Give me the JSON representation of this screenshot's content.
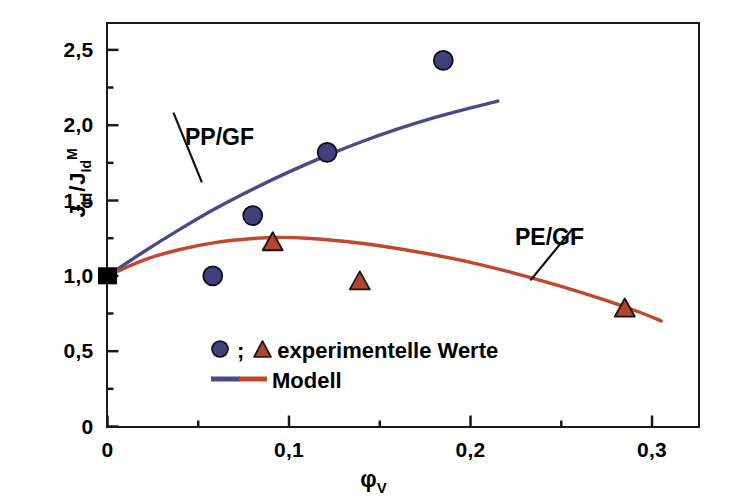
{
  "chart_data": {
    "type": "scatter",
    "title": "",
    "xlabel": "φ_V",
    "xlabel_base": "φ",
    "xlabel_sub": "V",
    "ylabel": "J_Id / J_Id^M",
    "ylabel_parts": {
      "j1": "J",
      "j1_sub": "Id",
      "slash": "/",
      "j2": "J",
      "j2_sub": "Id",
      "j2_sup": "M"
    },
    "xlim": [
      0,
      0.3256
    ],
    "ylim": [
      0,
      2.675
    ],
    "grid": false,
    "decimal_separator": ",",
    "legend_position": "inside-bottom-left",
    "xticks_major": [
      0,
      0.1,
      0.2,
      0.3
    ],
    "xticks_major_labels": [
      "0",
      "0,1",
      "0,2",
      "0,3"
    ],
    "xticks_minor": [
      0.05,
      0.15,
      0.25
    ],
    "yticks_major": [
      0,
      0.5,
      1.0,
      1.5,
      2.0,
      2.5
    ],
    "yticks_major_labels": [
      "0",
      "0,5",
      "1,0",
      "1,5",
      "2,0",
      "2,5"
    ],
    "yticks_minor": [
      0.25,
      0.75,
      1.25,
      1.75,
      2.25
    ],
    "series": [
      {
        "name": "PP/GF",
        "marker": "circle",
        "marker_color": "#40407a",
        "line_color": "#4a4a86",
        "points": [
          {
            "x": 0.0,
            "y": 1.0
          },
          {
            "x": 0.058,
            "y": 1.0
          },
          {
            "x": 0.08,
            "y": 1.4
          },
          {
            "x": 0.121,
            "y": 1.82
          },
          {
            "x": 0.185,
            "y": 2.43
          }
        ],
        "model_curve": [
          {
            "x": 0.0,
            "y": 1.0
          },
          {
            "x": 0.02,
            "y": 1.16
          },
          {
            "x": 0.04,
            "y": 1.31
          },
          {
            "x": 0.06,
            "y": 1.45
          },
          {
            "x": 0.08,
            "y": 1.575
          },
          {
            "x": 0.1,
            "y": 1.69
          },
          {
            "x": 0.12,
            "y": 1.795
          },
          {
            "x": 0.14,
            "y": 1.89
          },
          {
            "x": 0.16,
            "y": 1.975
          },
          {
            "x": 0.18,
            "y": 2.05
          },
          {
            "x": 0.2,
            "y": 2.115
          },
          {
            "x": 0.215,
            "y": 2.16
          }
        ]
      },
      {
        "name": "PE/GF",
        "marker": "triangle",
        "marker_color": "#b2452c",
        "line_color": "#c0482c",
        "points": [
          {
            "x": 0.0,
            "y": 1.0
          },
          {
            "x": 0.091,
            "y": 1.22
          },
          {
            "x": 0.139,
            "y": 0.96
          },
          {
            "x": 0.285,
            "y": 0.78
          }
        ],
        "model_curve": [
          {
            "x": 0.0,
            "y": 1.0
          },
          {
            "x": 0.02,
            "y": 1.105
          },
          {
            "x": 0.04,
            "y": 1.175
          },
          {
            "x": 0.06,
            "y": 1.222
          },
          {
            "x": 0.08,
            "y": 1.248
          },
          {
            "x": 0.095,
            "y": 1.255
          },
          {
            "x": 0.11,
            "y": 1.25
          },
          {
            "x": 0.13,
            "y": 1.23
          },
          {
            "x": 0.15,
            "y": 1.2
          },
          {
            "x": 0.175,
            "y": 1.15
          },
          {
            "x": 0.2,
            "y": 1.09
          },
          {
            "x": 0.225,
            "y": 1.015
          },
          {
            "x": 0.25,
            "y": 0.93
          },
          {
            "x": 0.275,
            "y": 0.835
          },
          {
            "x": 0.295,
            "y": 0.75
          },
          {
            "x": 0.305,
            "y": 0.7
          }
        ]
      }
    ],
    "origin_marker": {
      "name": "shared-origin-point",
      "x": 0.0,
      "y": 1.0,
      "marker": "square",
      "color": "#000000"
    },
    "annotations": [
      {
        "text": "PP/GF",
        "x": 0.022,
        "y": 1.99,
        "leader_to_x": 0.052,
        "leader_to_y": 1.62
      },
      {
        "text": "PE/GF",
        "x": 0.242,
        "y": 1.22,
        "leader_to_x": 0.233,
        "leader_to_y": 0.97
      }
    ],
    "legend": {
      "marker_entry": {
        "circle_marker": "circle",
        "separator": ";",
        "triangle_marker": "triangle",
        "label": "experimentelle Werte"
      },
      "line_entry": {
        "label": "Modell",
        "color_left": "#4a4a86",
        "color_right": "#c0482c"
      }
    },
    "colors": {
      "blue": "#4a4a86",
      "red": "#c0482c",
      "axis": "#1a1a1a",
      "background": "#ffffff",
      "marker_outline": "#000000"
    }
  }
}
